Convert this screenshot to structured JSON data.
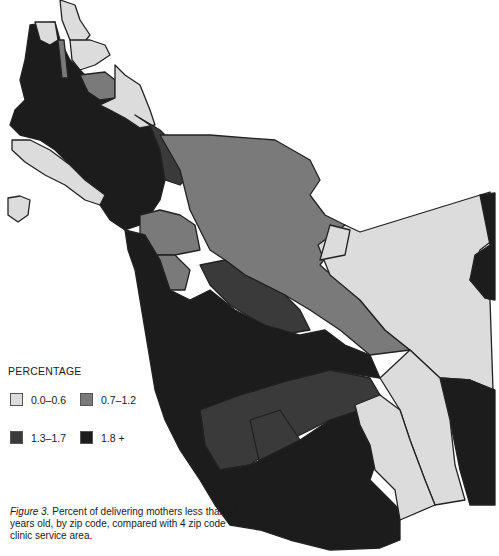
{
  "legend": {
    "title": "PERCENTAGE",
    "items": [
      {
        "label": "0.0–0.6",
        "color": "#dcdcdc"
      },
      {
        "label": "0.7–1.2",
        "color": "#7a7a7a"
      },
      {
        "label": "1.3–1.7",
        "color": "#3a3a3a"
      },
      {
        "label": "1.8 +",
        "color": "#1c1c1c"
      }
    ]
  },
  "caption": {
    "figure_label": "Figure 3.",
    "text": " Percent of delivering mothers less than 17 years old, by zip code, compared with 4 zip code clinic service area."
  },
  "colors": {
    "light": "#dcdcdc",
    "medium": "#7a7a7a",
    "dark": "#3a3a3a",
    "darkest": "#1c1c1c",
    "outline": "#222222"
  }
}
